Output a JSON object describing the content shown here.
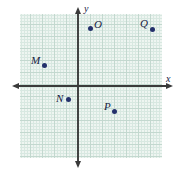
{
  "figure": {
    "background_color": "#ffffff",
    "grid": {
      "fill_color": "#eef5f1",
      "minor_line_color": "#d8e8e1",
      "major_line_color": "#c3d8cf",
      "minor_spacing_px": 3,
      "major_spacing_px": 12,
      "left_px": 20,
      "top_px": 14,
      "width_px": 142,
      "height_px": 144
    },
    "axes": {
      "color": "#3a3a3a",
      "origin_px": {
        "x": 78,
        "y": 86
      },
      "x_axis": {
        "label": "x",
        "label_px": {
          "x": 166,
          "y": 74
        },
        "start_px": {
          "x": 13,
          "y": 86
        },
        "end_px": {
          "x": 172,
          "y": 86
        },
        "arrows": "both"
      },
      "y_axis": {
        "label": "y",
        "label_px": {
          "x": 84,
          "y": 4
        },
        "start_px": {
          "x": 78,
          "y": 8
        },
        "end_px": {
          "x": 78,
          "y": 167
        },
        "arrows": "both"
      }
    },
    "point_color": "#23306b",
    "points": [
      {
        "label": "M",
        "px": {
          "x": 44,
          "y": 65
        },
        "label_px": {
          "x": 31,
          "y": 55
        },
        "grid_units": {
          "x": -2.8,
          "y": 1.75
        }
      },
      {
        "label": "N",
        "px": {
          "x": 68,
          "y": 99
        },
        "label_px": {
          "x": 56,
          "y": 93
        },
        "grid_units": {
          "x": -0.8,
          "y": -1.1
        }
      },
      {
        "label": "O",
        "px": {
          "x": 90,
          "y": 28
        },
        "label_px": {
          "x": 94,
          "y": 19
        },
        "grid_units": {
          "x": 1.0,
          "y": 4.8
        }
      },
      {
        "label": "P",
        "px": {
          "x": 114,
          "y": 111
        },
        "label_px": {
          "x": 104,
          "y": 101
        },
        "grid_units": {
          "x": 3.0,
          "y": -2.1
        }
      },
      {
        "label": "Q",
        "px": {
          "x": 152,
          "y": 29
        },
        "label_px": {
          "x": 140,
          "y": 18
        },
        "grid_units": {
          "x": 6.2,
          "y": 4.75
        }
      }
    ]
  }
}
